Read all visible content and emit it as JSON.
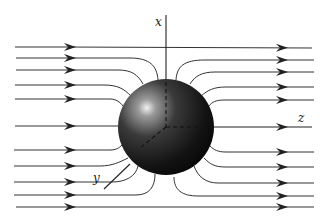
{
  "diagram": {
    "type": "flow-around-sphere",
    "axes": {
      "x": {
        "label": "x"
      },
      "y": {
        "label": "y"
      },
      "z": {
        "label": "z"
      }
    },
    "sphere": {
      "cx": 166,
      "cy": 127,
      "r": 48,
      "color": "#1a1a1a",
      "highlight": "#e8e8e8"
    },
    "streamlines": {
      "count": 11,
      "direction": "positive z (left to right)",
      "left_y": [
        47,
        58,
        70,
        85,
        99,
        126,
        150,
        166,
        182,
        195,
        207
      ],
      "right_y": [
        48,
        60,
        72,
        87,
        100,
        128,
        152,
        167,
        183,
        196,
        207
      ]
    }
  }
}
